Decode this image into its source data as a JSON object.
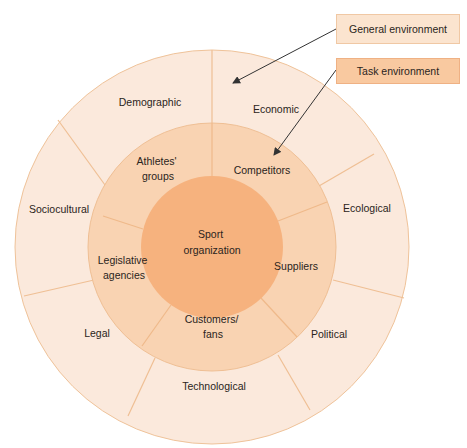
{
  "diagram": {
    "center_label": [
      "Sport",
      "organization"
    ],
    "task_environment": [
      {
        "lines": [
          "Athletes'",
          "groups"
        ]
      },
      {
        "lines": [
          "Competitors"
        ]
      },
      {
        "lines": [
          "Suppliers"
        ]
      },
      {
        "lines": [
          "Customers/",
          "fans"
        ]
      },
      {
        "lines": [
          "Legislative",
          "agencies"
        ]
      }
    ],
    "general_environment": [
      {
        "label": "Demographic"
      },
      {
        "label": "Economic"
      },
      {
        "label": "Ecological"
      },
      {
        "label": "Political"
      },
      {
        "label": "Technological"
      },
      {
        "label": "Legal"
      },
      {
        "label": "Sociocultural"
      }
    ]
  },
  "legend": {
    "general_label": "General environment",
    "task_label": "Task environment"
  },
  "colors": {
    "outer_ring": "#fbe9dc",
    "middle_ring": "#f9d3b2",
    "inner_circle": "#f6b27e",
    "divider": "#efbf94",
    "legend_general": "#fbe4cf",
    "legend_task": "#f9c9a0",
    "arrow": "#333333"
  }
}
